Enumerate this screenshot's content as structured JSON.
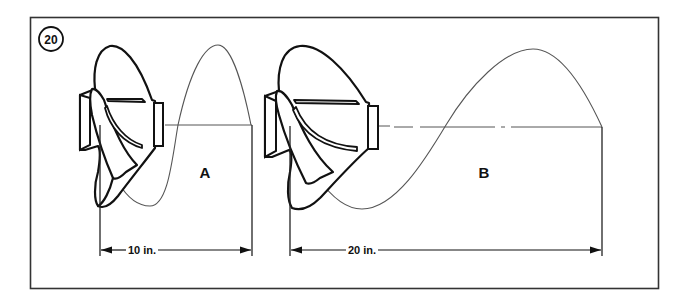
{
  "figure": {
    "number": "20",
    "panels": [
      {
        "id": "A",
        "label": "A",
        "pitch_label": "10 in.",
        "pitch_in": 10
      },
      {
        "id": "B",
        "label": "B",
        "pitch_label": "20 in.",
        "pitch_in": 20
      }
    ]
  },
  "colors": {
    "line": "#111111",
    "wave": "#555555",
    "frame": "#333333",
    "background": "#ffffff"
  }
}
